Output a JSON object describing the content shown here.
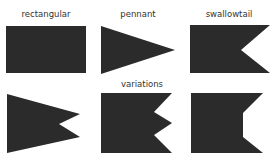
{
  "fill_color": "#2b2b2b",
  "labels": {
    "rectangular": "rectangular",
    "pennant": "pennant",
    "swallowtail": "swallowtail",
    "variations": "variations"
  },
  "shapes": [
    {
      "name": "rectangular",
      "points": "6,26 86,26 86,73 6,73"
    },
    {
      "name": "pennant",
      "points": "101,26 175,50 101,74"
    },
    {
      "name": "swallowtail",
      "points": "190,25 270,25 241,50 270,73 190,73"
    },
    {
      "name": "variation-angled-swallowtail",
      "points": "7,94 80,114 59,124 80,137 7,153"
    },
    {
      "name": "variation-double-swallowtail",
      "points": "101,93 172,93 154,112 172,123 154,135 172,153 101,153"
    },
    {
      "name": "variation-square-notch",
      "points": "191,93 263,93 243,113 243,137 263,153 191,153"
    }
  ]
}
